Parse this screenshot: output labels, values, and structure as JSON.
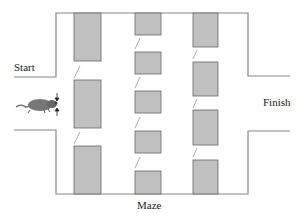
{
  "labels": {
    "start": "Start",
    "finish": "Finish",
    "caption": "Maze"
  },
  "colors": {
    "wall": "#888888",
    "block_fill": "#c0c0c0",
    "block_stroke": "#666666",
    "rat": "#777777"
  },
  "maze": {
    "columns": [
      {
        "name": "column-1",
        "blocks": [
          [
            74,
            13,
            101,
            87
          ],
          [
            74,
            107,
            101,
            150
          ],
          [
            74,
            172,
            101,
            195
          ]
        ]
      },
      {
        "name": "column-2",
        "blocks": [
          [
            135,
            13,
            161,
            38
          ],
          [
            135,
            52,
            161,
            76
          ],
          [
            135,
            91,
            161,
            115
          ],
          [
            135,
            131,
            161,
            155
          ],
          [
            135,
            172,
            161,
            195
          ]
        ]
      },
      {
        "name": "column-3",
        "blocks": [
          [
            193,
            13,
            219,
            47
          ],
          [
            193,
            62,
            219,
            96
          ],
          [
            193,
            110,
            219,
            145
          ],
          [
            193,
            160,
            219,
            195
          ]
        ]
      }
    ]
  },
  "icons": {
    "rat": "rat-icon",
    "arrows": "double-arrow-icon"
  }
}
